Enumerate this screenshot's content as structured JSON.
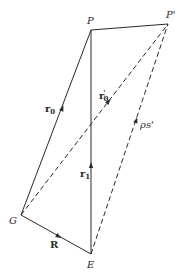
{
  "diagram": {
    "points": {
      "P": {
        "label": "P",
        "x": 91,
        "y": 30
      },
      "P_prime": {
        "label": "P'",
        "x": 168,
        "y": 24
      },
      "G": {
        "label": "G",
        "x": 21,
        "y": 215
      },
      "E": {
        "label": "E",
        "x": 91,
        "y": 254
      }
    },
    "vectors": {
      "r0": {
        "label": "r",
        "sub": "0",
        "from": "G",
        "to": "P",
        "style": "solid"
      },
      "r0_prime": {
        "label": "r",
        "sub": "0",
        "prime": "'",
        "from": "G",
        "to": "P'",
        "style": "dashed"
      },
      "rho_s_prime": {
        "label": "ρs'",
        "from": "E",
        "to": "P'",
        "style": "dashed"
      },
      "r1": {
        "label": "r",
        "sub": "1",
        "from": "E",
        "to": "P",
        "style": "solid"
      },
      "R": {
        "label": "R",
        "from": "G",
        "to": "E",
        "style": "solid"
      },
      "P_to_P_prime": {
        "label": "",
        "from": "P",
        "to": "P'",
        "style": "solid"
      }
    },
    "labels": {
      "P": "P",
      "P_prime": "P'",
      "G": "G",
      "E": "E",
      "r0_main": "r",
      "r0_sub": "0",
      "r0p_main": "r",
      "r0p_sub": "0",
      "r0p_prime": "'",
      "rho_s": "ρs'",
      "r1_main": "r",
      "r1_sub": "1",
      "R": "R"
    },
    "colors": {
      "stroke": "#2a2a2a",
      "background": "#ffffff"
    }
  }
}
